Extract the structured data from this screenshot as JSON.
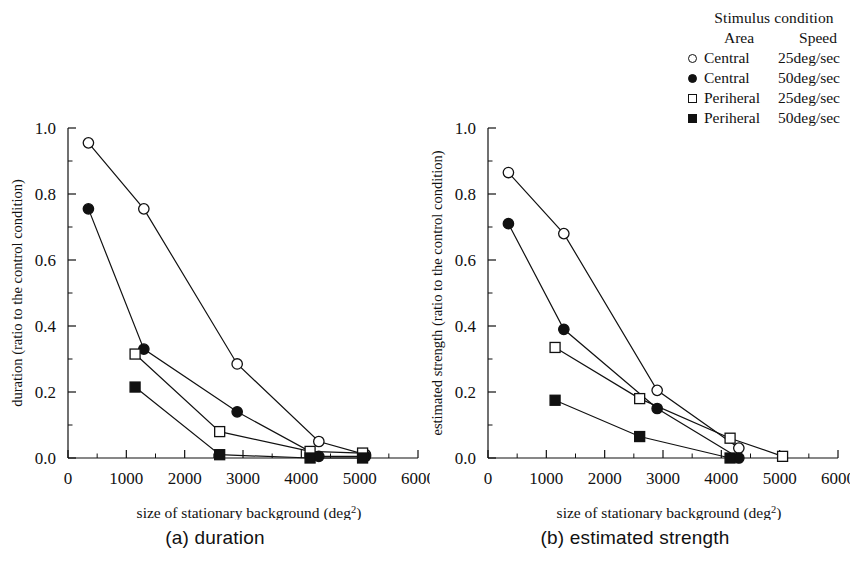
{
  "legend": {
    "title": "Stimulus condition",
    "col_area": "Area",
    "col_speed": "Speed",
    "rows": [
      {
        "marker": "circle-open",
        "area": "Central",
        "speed": "25deg/sec"
      },
      {
        "marker": "circle-filled",
        "area": "Central",
        "speed": "50deg/sec"
      },
      {
        "marker": "square-open",
        "area": "Periheral",
        "speed": "25deg/sec"
      },
      {
        "marker": "square-filled",
        "area": "Periheral",
        "speed": "50deg/sec"
      }
    ]
  },
  "panels": [
    {
      "id": "a",
      "caption": "(a)  duration",
      "xlabel_main": "size of stationary background (deg",
      "xlabel_sup": "2",
      "xlabel_tail": ")",
      "ylabel": "duration (ratio to the control condition)",
      "xticklabels": [
        "0",
        "1000",
        "2000",
        "3000",
        "4000",
        "5000",
        "6000"
      ],
      "yticklabels": [
        "0.0",
        "0.2",
        "0.4",
        "0.6",
        "0.8",
        "1.0"
      ]
    },
    {
      "id": "b",
      "caption": "(b)  estimated strength",
      "xlabel_main": "size of stationary background (deg",
      "xlabel_sup": "2",
      "xlabel_tail": ")",
      "ylabel": "estimated strength (ratio to the control condition)",
      "xticklabels": [
        "0",
        "1000",
        "2000",
        "3000",
        "4000",
        "5000",
        "6000"
      ],
      "yticklabels": [
        "0.0",
        "0.2",
        "0.4",
        "0.6",
        "0.8",
        "1.0"
      ]
    }
  ],
  "chart_data": [
    {
      "type": "line",
      "panel": "a",
      "title": "(a)  duration",
      "xlabel": "size of stationary background (deg^2)",
      "ylabel": "duration (ratio to the control condition)",
      "xlim": [
        0,
        6000
      ],
      "ylim": [
        0.0,
        1.0
      ],
      "xticks": [
        0,
        1000,
        2000,
        3000,
        4000,
        5000,
        6000
      ],
      "yticks": [
        0.0,
        0.2,
        0.4,
        0.6,
        0.8,
        1.0
      ],
      "x_minor_step": 500,
      "y_minor_step": 0.1,
      "grid": false,
      "legend_position": "outside-top-right",
      "series": [
        {
          "name": "Central 25deg/sec",
          "marker": "circle-open",
          "points": [
            [
              350,
              0.955
            ],
            [
              1300,
              0.755
            ],
            [
              2900,
              0.285
            ],
            [
              4300,
              0.05
            ],
            [
              5100,
              0.01
            ]
          ]
        },
        {
          "name": "Central 50deg/sec",
          "marker": "circle-filled",
          "points": [
            [
              350,
              0.755
            ],
            [
              1300,
              0.33
            ],
            [
              2900,
              0.14
            ],
            [
              4300,
              0.005
            ],
            [
              5100,
              0.005
            ]
          ]
        },
        {
          "name": "Periheral 25deg/sec",
          "marker": "square-open",
          "points": [
            [
              1150,
              0.315
            ],
            [
              2600,
              0.08
            ],
            [
              4150,
              0.02
            ],
            [
              5050,
              0.015
            ]
          ]
        },
        {
          "name": "Periheral 50deg/sec",
          "marker": "square-filled",
          "points": [
            [
              1150,
              0.215
            ],
            [
              2600,
              0.01
            ],
            [
              4150,
              0.0
            ],
            [
              5050,
              0.0
            ]
          ]
        }
      ]
    },
    {
      "type": "line",
      "panel": "b",
      "title": "(b)  estimated strength",
      "xlabel": "size of stationary background (deg^2)",
      "ylabel": "estimated strength (ratio to the control condition)",
      "xlim": [
        0,
        6000
      ],
      "ylim": [
        0.0,
        1.0
      ],
      "xticks": [
        0,
        1000,
        2000,
        3000,
        4000,
        5000,
        6000
      ],
      "yticks": [
        0.0,
        0.2,
        0.4,
        0.6,
        0.8,
        1.0
      ],
      "x_minor_step": 500,
      "y_minor_step": 0.1,
      "grid": false,
      "legend_position": "outside-top-right",
      "series": [
        {
          "name": "Central 25deg/sec",
          "marker": "circle-open",
          "points": [
            [
              350,
              0.865
            ],
            [
              1300,
              0.68
            ],
            [
              2900,
              0.205
            ],
            [
              4300,
              0.03
            ]
          ]
        },
        {
          "name": "Central 50deg/sec",
          "marker": "circle-filled",
          "points": [
            [
              350,
              0.71
            ],
            [
              1300,
              0.39
            ],
            [
              2900,
              0.15
            ],
            [
              4300,
              0.0
            ]
          ]
        },
        {
          "name": "Periheral 25deg/sec",
          "marker": "square-open",
          "points": [
            [
              1150,
              0.335
            ],
            [
              2600,
              0.18
            ],
            [
              4150,
              0.06
            ],
            [
              5050,
              0.005
            ]
          ]
        },
        {
          "name": "Periheral 50deg/sec",
          "marker": "square-filled",
          "points": [
            [
              1150,
              0.175
            ],
            [
              2600,
              0.065
            ],
            [
              4150,
              0.0
            ]
          ]
        }
      ]
    }
  ]
}
